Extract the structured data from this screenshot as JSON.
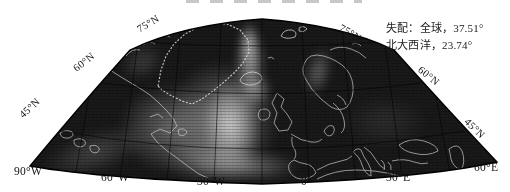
{
  "annotation": {
    "line1": "失配：全球，37.51°",
    "line2": "北大西洋，23.74°",
    "values": {
      "global_mismatch_deg": 37.51,
      "north_atlantic_mismatch_deg": 23.74
    }
  },
  "map": {
    "lat_labels_left": [
      "75°N",
      "60°N",
      "45°N"
    ],
    "lat_labels_right": [
      "75°N",
      "60°N",
      "45°N"
    ],
    "lon_labels": [
      "90°W",
      "60°W",
      "30°W",
      "0°",
      "30°E",
      "60°E"
    ]
  },
  "colors": {
    "background": "#ffffff",
    "sea_dark": "#1a1a1a",
    "field_bright": "#d8d8d8",
    "coastline": "#c6c6c6",
    "graticule": "#000000",
    "text": "#111111"
  }
}
